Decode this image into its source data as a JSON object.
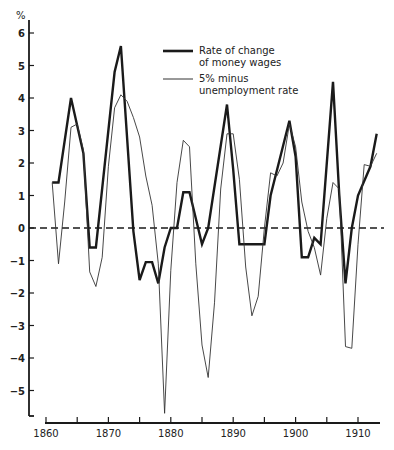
{
  "chart_data": {
    "type": "line",
    "title": "",
    "xlabel": "",
    "ylabel": "%",
    "xlim": [
      1860,
      1913
    ],
    "ylim": [
      -5.8,
      6.3
    ],
    "grid": false,
    "zero_line": "dashed",
    "legend_position": "upper center",
    "x_ticks": [
      1860,
      1865,
      1870,
      1875,
      1880,
      1885,
      1890,
      1895,
      1900,
      1905,
      1910
    ],
    "x_tick_labels": [
      "1860",
      "1870",
      "1880",
      "1890",
      "1900",
      "1910"
    ],
    "y_ticks": [
      6,
      5,
      4,
      3,
      2,
      1,
      0,
      -1,
      -2,
      -3,
      -4,
      -5
    ],
    "y_tick_labels": [
      "6",
      "5",
      "4",
      "3",
      "2",
      "1",
      "0",
      "-1",
      "-2",
      "-3",
      "-4",
      "-5"
    ],
    "series": [
      {
        "name": "Rate of change of money wages",
        "style": "thick",
        "points": [
          [
            1861,
            1.4
          ],
          [
            1862,
            1.4
          ],
          [
            1864,
            4.0
          ],
          [
            1866,
            2.3
          ],
          [
            1867,
            -0.6
          ],
          [
            1868,
            -0.6
          ],
          [
            1871,
            4.8
          ],
          [
            1872,
            5.6
          ],
          [
            1874,
            -0.1
          ],
          [
            1875,
            -1.6
          ],
          [
            1876,
            -1.05
          ],
          [
            1877,
            -1.05
          ],
          [
            1878,
            -1.7
          ],
          [
            1879,
            -0.6
          ],
          [
            1880,
            0
          ],
          [
            1881,
            0
          ],
          [
            1882,
            1.1
          ],
          [
            1883,
            1.1
          ],
          [
            1885,
            -0.5
          ],
          [
            1886,
            0
          ],
          [
            1889,
            3.8
          ],
          [
            1890,
            1.8
          ],
          [
            1891,
            -0.5
          ],
          [
            1895,
            -0.5
          ],
          [
            1896,
            1.0
          ],
          [
            1899,
            3.3
          ],
          [
            1900,
            2.2
          ],
          [
            1901,
            -0.9
          ],
          [
            1902,
            -0.9
          ],
          [
            1903,
            -0.3
          ],
          [
            1904,
            -0.5
          ],
          [
            1906,
            4.5
          ],
          [
            1907,
            1.0
          ],
          [
            1908,
            -1.7
          ],
          [
            1909,
            0
          ],
          [
            1910,
            1.0
          ],
          [
            1912,
            1.9
          ],
          [
            1913,
            2.9
          ]
        ]
      },
      {
        "name": "5% minus unemployment rate",
        "style": "thin",
        "points": [
          [
            1861,
            1.4
          ],
          [
            1862,
            -1.1
          ],
          [
            1863,
            0.8
          ],
          [
            1864,
            3.1
          ],
          [
            1865,
            3.2
          ],
          [
            1866,
            2.4
          ],
          [
            1867,
            -1.35
          ],
          [
            1868,
            -1.8
          ],
          [
            1869,
            -0.9
          ],
          [
            1870,
            1.9
          ],
          [
            1871,
            3.7
          ],
          [
            1872,
            4.1
          ],
          [
            1873,
            3.9
          ],
          [
            1874,
            3.4
          ],
          [
            1875,
            2.8
          ],
          [
            1876,
            1.6
          ],
          [
            1877,
            0.7
          ],
          [
            1878,
            -1.1
          ],
          [
            1879,
            -5.7
          ],
          [
            1880,
            -1.3
          ],
          [
            1881,
            1.4
          ],
          [
            1882,
            2.7
          ],
          [
            1883,
            2.5
          ],
          [
            1884,
            -1.1
          ],
          [
            1885,
            -3.6
          ],
          [
            1886,
            -4.6
          ],
          [
            1887,
            -2.3
          ],
          [
            1888,
            1.2
          ],
          [
            1889,
            2.9
          ],
          [
            1890,
            2.9
          ],
          [
            1891,
            1.5
          ],
          [
            1892,
            -1.2
          ],
          [
            1893,
            -2.7
          ],
          [
            1894,
            -2.1
          ],
          [
            1895,
            0
          ],
          [
            1896,
            1.7
          ],
          [
            1897,
            1.6
          ],
          [
            1898,
            2.0
          ],
          [
            1899,
            3.2
          ],
          [
            1900,
            2.5
          ],
          [
            1901,
            0.8
          ],
          [
            1902,
            -0.1
          ],
          [
            1903,
            -0.6
          ],
          [
            1904,
            -1.45
          ],
          [
            1905,
            0.3
          ],
          [
            1906,
            1.4
          ],
          [
            1907,
            1.2
          ],
          [
            1908,
            -3.65
          ],
          [
            1909,
            -3.7
          ],
          [
            1910,
            -0.5
          ],
          [
            1911,
            1.95
          ],
          [
            1912,
            1.9
          ],
          [
            1913,
            2.3
          ]
        ]
      }
    ],
    "legend": [
      {
        "line1": "Rate of change",
        "line2": "of money wages",
        "style": "thick"
      },
      {
        "line1": "5% minus",
        "line2": "unemployment rate",
        "style": "thin"
      }
    ]
  },
  "colors": {
    "ink": "#1a1a1a",
    "thin_ink": "#333333",
    "background": "#ffffff"
  }
}
